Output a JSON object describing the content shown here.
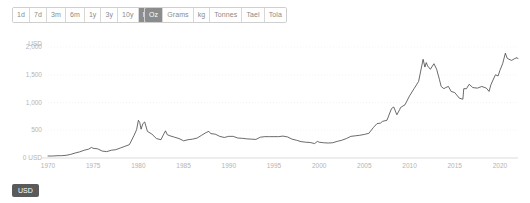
{
  "toolbar": {
    "range_buttons": [
      {
        "label": "1d",
        "active": false
      },
      {
        "label": "7d",
        "active": false
      },
      {
        "label": "3m",
        "active": false
      },
      {
        "label": "6m",
        "active": false
      },
      {
        "label": "1y",
        "active": false
      },
      {
        "label": "3y",
        "active": false
      },
      {
        "label": "10y",
        "active": false
      },
      {
        "label": "Max",
        "active": true
      }
    ],
    "unit_buttons": [
      {
        "label": "Oz",
        "active": true
      },
      {
        "label": "Grams",
        "active": false
      },
      {
        "label": "kg",
        "active": false
      },
      {
        "label": "Tonnes",
        "active": false
      },
      {
        "label": "Tael",
        "active": false
      },
      {
        "label": "Tola",
        "active": false
      }
    ]
  },
  "footer": {
    "currency_badge": "USD"
  },
  "colors": {
    "accent": "#8c8c8c",
    "badge": "#5a5a5a",
    "line": "#3a3a3a",
    "grid": "#ededed",
    "tick_text": "#b4b4b4"
  },
  "chart_data": {
    "type": "line",
    "title": "",
    "xlabel": "",
    "ylabel": "USD",
    "unit": "Oz",
    "currency": "USD",
    "range": "Max",
    "grid": true,
    "legend": "none",
    "xlim": [
      1970,
      2022
    ],
    "ylim": [
      0,
      2200
    ],
    "y_axis_unit_label": "USD",
    "y_ticks": [
      {
        "value": 0,
        "label": "0 USD"
      },
      {
        "value": 500,
        "label": "500"
      },
      {
        "value": 1000,
        "label": "1,000"
      },
      {
        "value": 1500,
        "label": "1,500"
      },
      {
        "value": 2000,
        "label": "2,000"
      }
    ],
    "x_ticks": [
      {
        "value": 1970,
        "label": "1970"
      },
      {
        "value": 1975,
        "label": "1975"
      },
      {
        "value": 1980,
        "label": "1980"
      },
      {
        "value": 1985,
        "label": "1985"
      },
      {
        "value": 1990,
        "label": "1990"
      },
      {
        "value": 1995,
        "label": "1995"
      },
      {
        "value": 2000,
        "label": "2000"
      },
      {
        "value": 2005,
        "label": "2005"
      },
      {
        "value": 2010,
        "label": "2010"
      },
      {
        "value": 2015,
        "label": "2015"
      },
      {
        "value": 2020,
        "label": "2020"
      }
    ],
    "series": [
      {
        "name": "Gold price per Oz (USD)",
        "x": [
          1970.0,
          1970.5,
          1971.0,
          1971.5,
          1972.0,
          1972.5,
          1973.0,
          1973.5,
          1974.0,
          1974.5,
          1974.8,
          1975.0,
          1975.5,
          1976.0,
          1976.5,
          1977.0,
          1977.5,
          1978.0,
          1978.5,
          1979.0,
          1979.5,
          1979.8,
          1980.0,
          1980.15,
          1980.3,
          1980.5,
          1980.7,
          1981.0,
          1981.5,
          1982.0,
          1982.5,
          1982.8,
          1983.0,
          1983.2,
          1983.5,
          1984.0,
          1984.5,
          1985.0,
          1985.5,
          1986.0,
          1986.5,
          1987.0,
          1987.5,
          1987.8,
          1988.0,
          1988.5,
          1989.0,
          1989.5,
          1990.0,
          1990.5,
          1991.0,
          1991.5,
          1992.0,
          1992.5,
          1993.0,
          1993.5,
          1994.0,
          1994.5,
          1995.0,
          1995.5,
          1996.0,
          1996.5,
          1997.0,
          1997.5,
          1998.0,
          1998.5,
          1999.0,
          1999.5,
          1999.8,
          2000.0,
          2000.5,
          2001.0,
          2001.5,
          2002.0,
          2002.5,
          2003.0,
          2003.5,
          2004.0,
          2004.5,
          2005.0,
          2005.5,
          2006.0,
          2006.4,
          2006.8,
          2007.0,
          2007.5,
          2008.0,
          2008.25,
          2008.6,
          2008.9,
          2009.0,
          2009.5,
          2010.0,
          2010.5,
          2011.0,
          2011.5,
          2011.7,
          2011.85,
          2012.0,
          2012.3,
          2012.7,
          2013.0,
          2013.3,
          2013.5,
          2013.8,
          2014.0,
          2014.3,
          2014.6,
          2015.0,
          2015.5,
          2015.9,
          2016.0,
          2016.3,
          2016.6,
          2017.0,
          2017.5,
          2018.0,
          2018.5,
          2018.8,
          2019.0,
          2019.5,
          2019.8,
          2020.0,
          2020.3,
          2020.6,
          2020.8,
          2021.0,
          2021.3,
          2021.6,
          2021.9,
          2022.0
        ],
        "values": [
          36,
          36,
          41,
          42,
          48,
          65,
          90,
          110,
          140,
          160,
          190,
          175,
          165,
          125,
          115,
          140,
          150,
          180,
          210,
          240,
          400,
          510,
          680,
          640,
          520,
          620,
          650,
          480,
          430,
          350,
          330,
          430,
          490,
          420,
          400,
          375,
          350,
          310,
          330,
          340,
          360,
          410,
          460,
          480,
          440,
          430,
          390,
          370,
          390,
          390,
          360,
          355,
          345,
          340,
          335,
          375,
          385,
          385,
          385,
          385,
          395,
          380,
          340,
          320,
          295,
          285,
          280,
          260,
          300,
          285,
          275,
          270,
          275,
          300,
          320,
          350,
          390,
          400,
          410,
          425,
          445,
          550,
          620,
          630,
          660,
          680,
          890,
          920,
          780,
          870,
          910,
          960,
          1120,
          1250,
          1380,
          1780,
          1640,
          1720,
          1660,
          1600,
          1700,
          1600,
          1420,
          1290,
          1250,
          1270,
          1290,
          1200,
          1180,
          1080,
          1060,
          1250,
          1250,
          1330,
          1270,
          1260,
          1290,
          1260,
          1200,
          1320,
          1500,
          1480,
          1580,
          1700,
          1890,
          1800,
          1780,
          1760,
          1790,
          1810,
          1790
        ],
        "annotations": [
          {
            "label": "1980 peak",
            "x": 1980.0,
            "y": 680
          },
          {
            "label": "2011 peak",
            "x": 2011.5,
            "y": 1780
          },
          {
            "label": "2020 peak",
            "x": 2020.6,
            "y": 1890
          }
        ]
      }
    ]
  }
}
